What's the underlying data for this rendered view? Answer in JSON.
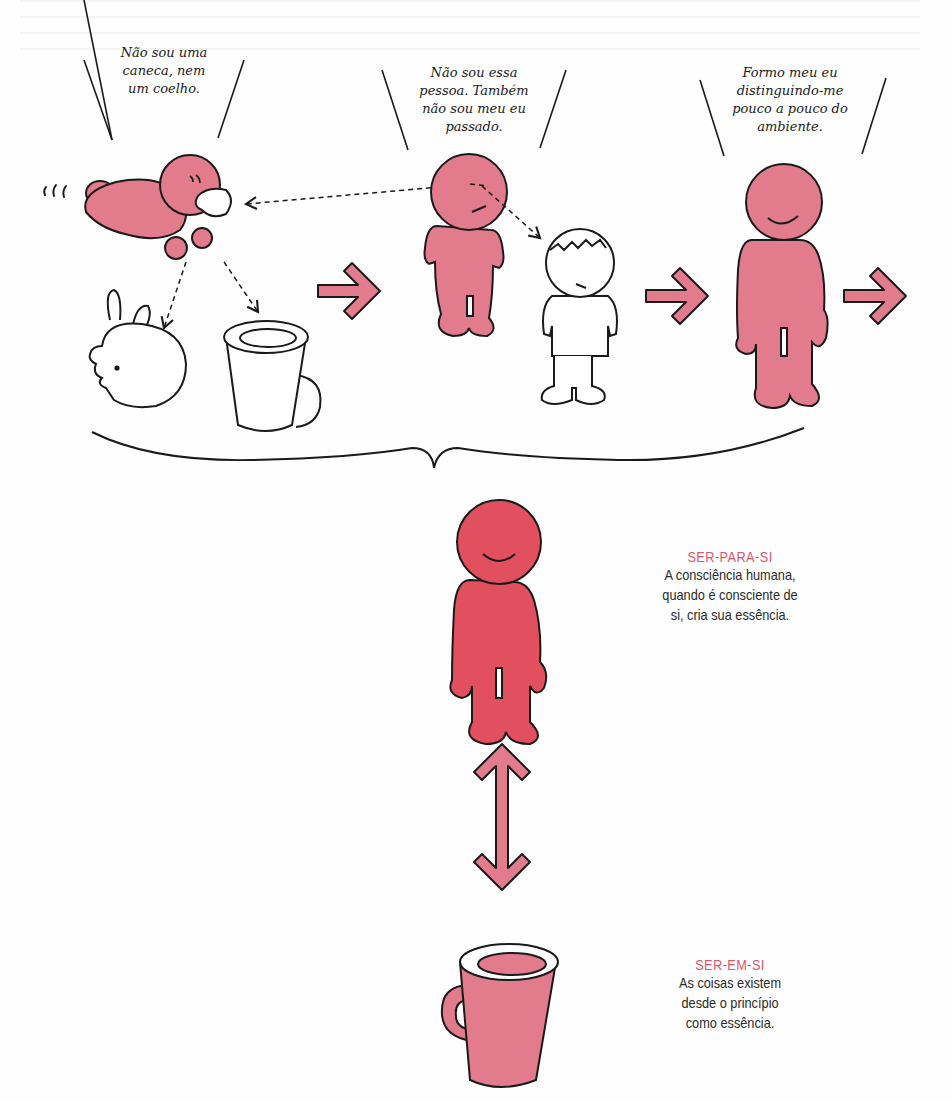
{
  "colors": {
    "pink_fill": "#e27b8b",
    "red_fill": "#e2505f",
    "label_accent": "#d9576a",
    "outline": "#1a1a1a",
    "body_text": "#2a2a2a"
  },
  "top_row": {
    "bubbles": [
      {
        "lines": [
          "Não sou uma",
          "caneca, nem",
          "um coelho."
        ]
      },
      {
        "lines": [
          "Não sou essa",
          "pessoa. Também",
          "não sou meu eu",
          "passado."
        ]
      },
      {
        "lines": [
          "Formo meu eu",
          "distinguindo-me",
          "pouco a pouco do",
          "ambiente."
        ]
      }
    ],
    "figures": [
      {
        "name": "crawling-baby",
        "fill": "pink"
      },
      {
        "name": "rabbit",
        "fill": "none"
      },
      {
        "name": "mug",
        "fill": "none"
      },
      {
        "name": "standing-person-neutral",
        "fill": "pink"
      },
      {
        "name": "past-self-boy",
        "fill": "none"
      },
      {
        "name": "standing-person-smiling",
        "fill": "pink"
      }
    ],
    "motion_marks": "‘‘‘"
  },
  "concepts": [
    {
      "title": "SER-PARA-SI",
      "lines": [
        "A consciência humana,",
        "quando é consciente de",
        "si, cria sua essência."
      ]
    },
    {
      "title": "SER-EM-SI",
      "lines": [
        "As coisas existem",
        "desde o princípio",
        "como essência."
      ]
    }
  ]
}
